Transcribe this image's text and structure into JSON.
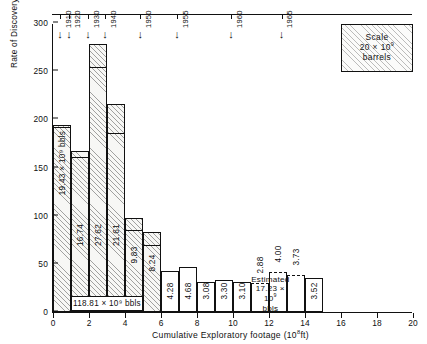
{
  "chart_data": {
    "type": "bar",
    "title": "",
    "xlabel": "Cumulative Exploratory footage (10⁸ ft)",
    "ylabel": "Rate of Discovery dQ/dh (bbls/ft drilled)",
    "xlim": [
      0,
      20
    ],
    "ylim": [
      0,
      300
    ],
    "xticks": [
      0,
      2,
      4,
      6,
      8,
      10,
      12,
      14,
      16,
      18,
      20
    ],
    "yticks": [
      0,
      50,
      100,
      150,
      200,
      250,
      300
    ],
    "grid": false,
    "legend_position": "top-right",
    "bins": [
      {
        "x0": 0,
        "x1": 1,
        "value": 194,
        "segment_value": 190,
        "label": "19.43 × 10⁹ bbls",
        "estimated": false
      },
      {
        "x0": 1,
        "x1": 2,
        "value": 167,
        "segment_value": 159,
        "label": "16.74",
        "estimated": false
      },
      {
        "x0": 2,
        "x1": 3,
        "value": 278,
        "segment_value": 252,
        "label": "27.62",
        "estimated": false
      },
      {
        "x0": 3,
        "x1": 4,
        "value": 216,
        "segment_value": 184,
        "label": "21.61",
        "estimated": false
      },
      {
        "x0": 4,
        "x1": 5,
        "value": 98,
        "segment_value": 83,
        "label": "9.83",
        "estimated": false
      },
      {
        "x0": 5,
        "x1": 6,
        "value": 83,
        "segment_value": 68,
        "label": "8.24",
        "estimated": false
      },
      {
        "x0": 6,
        "x1": 7,
        "value": 43,
        "segment_value": 43,
        "label": "4.28",
        "estimated": false
      },
      {
        "x0": 7,
        "x1": 8,
        "value": 47,
        "segment_value": 47,
        "label": "4.68",
        "estimated": false
      },
      {
        "x0": 8,
        "x1": 9,
        "value": 31,
        "segment_value": 31,
        "label": "3.08",
        "estimated": false
      },
      {
        "x0": 9,
        "x1": 10,
        "value": 33,
        "segment_value": 33,
        "label": "3.30",
        "estimated": false
      },
      {
        "x0": 10,
        "x1": 11,
        "value": 31,
        "segment_value": 31,
        "label": "3.10",
        "estimated": false
      },
      {
        "x0": 11,
        "x1": 12,
        "value": 29,
        "segment_value": 29,
        "label": "2.88",
        "estimated": true
      },
      {
        "x0": 12,
        "x1": 13,
        "value": 40,
        "segment_value": 40,
        "label": "4.00",
        "estimated": true
      },
      {
        "x0": 13,
        "x1": 14,
        "value": 37,
        "segment_value": 37,
        "label": "3.73",
        "estimated": true
      },
      {
        "x0": 14,
        "x1": 15,
        "value": 35,
        "segment_value": 35,
        "label": "3.52",
        "estimated": false
      }
    ],
    "year_markers": [
      {
        "year": "1910",
        "x": 0.45
      },
      {
        "year": "1920",
        "x": 0.95
      },
      {
        "year": "1930",
        "x": 2.0
      },
      {
        "year": "1940",
        "x": 2.95
      },
      {
        "year": "1950",
        "x": 4.9
      },
      {
        "year": "1955",
        "x": 6.95
      },
      {
        "year": "1960",
        "x": 9.95
      },
      {
        "year": "1965",
        "x": 12.75
      }
    ],
    "annotations": [
      {
        "id": "cumulative-discovered",
        "text": "118.81 × 10⁹ bbls",
        "x0": 1.0,
        "x1": 5.0
      },
      {
        "id": "estimated-future",
        "line1": "Estimated",
        "line2": "17.23 × 10⁹",
        "line3": "bbls",
        "x0": 11.0,
        "x1": 13.15
      }
    ],
    "legend": {
      "line1": "Scale",
      "line2": "20 × 10⁹",
      "line3": "barrels",
      "x0": 16.0,
      "x1": 20.0
    }
  },
  "axes": {
    "y_title": "Rate of Discovery ",
    "y_title_italic": "dQ/dh",
    "y_title_tail": " (bbls/ ft drilled)",
    "x_title": "Cumulative Exploratory footage (10",
    "x_title_sup": "8",
    "x_title_tail": "ft)"
  },
  "colors": {
    "ink": "#111111",
    "paper": "#ffffff",
    "hatch": "#282828"
  }
}
